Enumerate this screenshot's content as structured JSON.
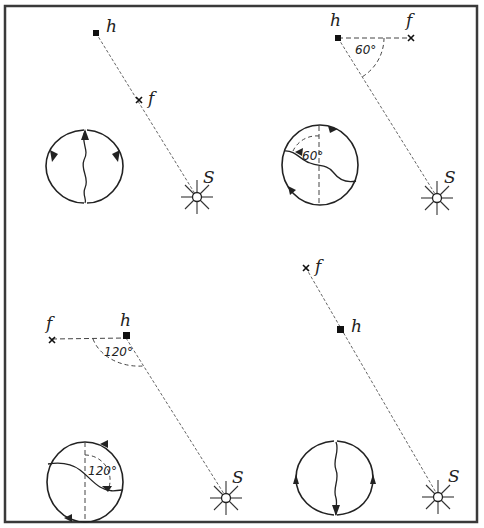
{
  "figure": {
    "panels": [
      {
        "id": "top-left",
        "labels": {
          "hive": "h",
          "food": "f",
          "sun": "S"
        },
        "angle_label": "",
        "configuration": "food directly toward the sun",
        "dance": "waggle run straight up"
      },
      {
        "id": "top-right",
        "labels": {
          "hive": "h",
          "food": "f",
          "sun": "S"
        },
        "angle_label": "60°",
        "dance_angle_label": "60°",
        "configuration": "food 60° left of the sun direction",
        "dance": "waggle run 60° from vertical"
      },
      {
        "id": "bottom-left",
        "labels": {
          "hive": "h",
          "food": "f",
          "sun": "S"
        },
        "angle_label": "120°",
        "dance_angle_label": "120°",
        "configuration": "food 120° right of sun direction",
        "dance": "waggle run 120° from vertical"
      },
      {
        "id": "bottom-right",
        "labels": {
          "hive": "h",
          "food": "f",
          "sun": "S"
        },
        "angle_label": "",
        "configuration": "food directly away from the sun",
        "dance": "waggle run straight down"
      }
    ]
  },
  "colors": {
    "ink": "#222222",
    "frame": "#3a3a3a",
    "background": "#ffffff"
  }
}
